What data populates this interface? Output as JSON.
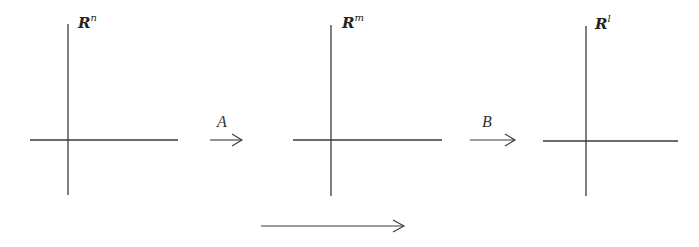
{
  "diagram": {
    "spaces": [
      {
        "base": "R",
        "exponent": "n",
        "origin": [
          68,
          140
        ]
      },
      {
        "base": "R",
        "exponent": "m",
        "origin": [
          331,
          140
        ]
      },
      {
        "base": "R",
        "exponent": "l",
        "origin": [
          586,
          140
        ]
      }
    ],
    "maps": [
      {
        "label": "A",
        "from": "R^n",
        "to": "R^m"
      },
      {
        "label": "B",
        "from": "R^m",
        "to": "R^l"
      },
      {
        "label": "",
        "from": "R^n",
        "to": "R^l",
        "note": "composite arrow below"
      }
    ],
    "colors": {
      "stroke": "#3a3a3a",
      "background": "#ffffff"
    }
  }
}
